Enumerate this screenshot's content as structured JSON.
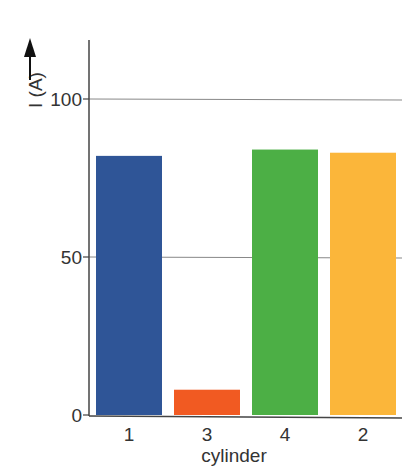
{
  "chart_data": {
    "type": "bar",
    "title": "",
    "xlabel": "cylinder",
    "ylabel": "I (A)",
    "categories": [
      "1",
      "3",
      "4",
      "2"
    ],
    "values": [
      82,
      8,
      84,
      83
    ],
    "colors": [
      "#2f5597",
      "#f15a22",
      "#4caf45",
      "#fbb63a"
    ],
    "ylim": [
      0,
      120
    ],
    "yticks": [
      0,
      50,
      100
    ],
    "ytick_labels": [
      "0",
      "50",
      "100"
    ],
    "grid": true,
    "legend": "none",
    "ylabel_arrow": "up-arrow"
  }
}
